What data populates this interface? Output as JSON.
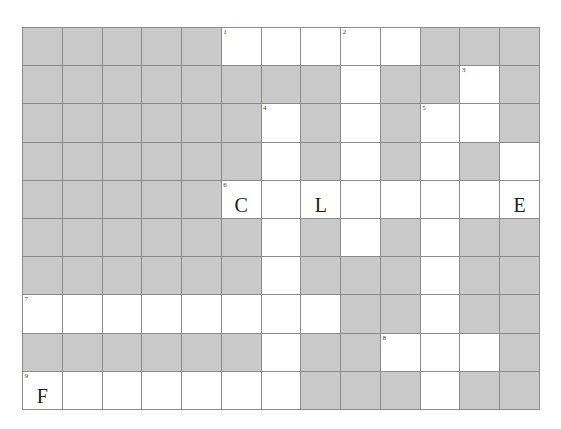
{
  "puzzle": {
    "title": "Crossword Grid",
    "columns": 13,
    "rows": 10,
    "colors": {
      "block_fill": "#c9c9c9",
      "open_fill": "#ffffff",
      "grid_line": "#8b8b8b",
      "text": "#1a1a1a",
      "number_text": "#3a3a3a"
    },
    "legend": {
      "block": "shaded/blocked square",
      "open": "fillable white square"
    },
    "clue_numbers": [
      1,
      2,
      3,
      4,
      5,
      6,
      7,
      8,
      9
    ],
    "filled_letters": [
      {
        "number": 6,
        "row": 5,
        "col": 6,
        "letter": "C"
      },
      {
        "row": 5,
        "col": 8,
        "letter": "L"
      },
      {
        "row": 5,
        "col": 13,
        "letter": "E"
      },
      {
        "number": 9,
        "row": 10,
        "col": 1,
        "letter": "F"
      }
    ],
    "cells": [
      [
        {
          "t": "block"
        },
        {
          "t": "block"
        },
        {
          "t": "block"
        },
        {
          "t": "block"
        },
        {
          "t": "block"
        },
        {
          "t": "open",
          "n": "1"
        },
        {
          "t": "open"
        },
        {
          "t": "open"
        },
        {
          "t": "open",
          "n": "2"
        },
        {
          "t": "open"
        },
        {
          "t": "block"
        },
        {
          "t": "block"
        },
        {
          "t": "block"
        }
      ],
      [
        {
          "t": "block"
        },
        {
          "t": "block"
        },
        {
          "t": "block"
        },
        {
          "t": "block"
        },
        {
          "t": "block"
        },
        {
          "t": "block"
        },
        {
          "t": "block"
        },
        {
          "t": "block"
        },
        {
          "t": "open"
        },
        {
          "t": "block"
        },
        {
          "t": "block"
        },
        {
          "t": "open",
          "n": "3"
        },
        {
          "t": "block"
        }
      ],
      [
        {
          "t": "block"
        },
        {
          "t": "block"
        },
        {
          "t": "block"
        },
        {
          "t": "block"
        },
        {
          "t": "block"
        },
        {
          "t": "block"
        },
        {
          "t": "open",
          "n": "4"
        },
        {
          "t": "block"
        },
        {
          "t": "open"
        },
        {
          "t": "block"
        },
        {
          "t": "open",
          "n": "5"
        },
        {
          "t": "open"
        },
        {
          "t": "block"
        }
      ],
      [
        {
          "t": "block"
        },
        {
          "t": "block"
        },
        {
          "t": "block"
        },
        {
          "t": "block"
        },
        {
          "t": "block"
        },
        {
          "t": "block"
        },
        {
          "t": "open"
        },
        {
          "t": "block"
        },
        {
          "t": "open"
        },
        {
          "t": "block"
        },
        {
          "t": "open"
        },
        {
          "t": "block"
        },
        {
          "t": "open"
        }
      ],
      [
        {
          "t": "block"
        },
        {
          "t": "block"
        },
        {
          "t": "block"
        },
        {
          "t": "block"
        },
        {
          "t": "block"
        },
        {
          "t": "open",
          "n": "6",
          "l": "C"
        },
        {
          "t": "open"
        },
        {
          "t": "open",
          "l": "L"
        },
        {
          "t": "open"
        },
        {
          "t": "open"
        },
        {
          "t": "open"
        },
        {
          "t": "open"
        },
        {
          "t": "open",
          "l": "E"
        }
      ],
      [
        {
          "t": "block"
        },
        {
          "t": "block"
        },
        {
          "t": "block"
        },
        {
          "t": "block"
        },
        {
          "t": "block"
        },
        {
          "t": "block"
        },
        {
          "t": "open"
        },
        {
          "t": "block"
        },
        {
          "t": "open"
        },
        {
          "t": "block"
        },
        {
          "t": "open"
        },
        {
          "t": "block"
        },
        {
          "t": "block"
        }
      ],
      [
        {
          "t": "block"
        },
        {
          "t": "block"
        },
        {
          "t": "block"
        },
        {
          "t": "block"
        },
        {
          "t": "block"
        },
        {
          "t": "block"
        },
        {
          "t": "open"
        },
        {
          "t": "block"
        },
        {
          "t": "block"
        },
        {
          "t": "block"
        },
        {
          "t": "open"
        },
        {
          "t": "block"
        },
        {
          "t": "block"
        }
      ],
      [
        {
          "t": "open",
          "n": "7"
        },
        {
          "t": "open"
        },
        {
          "t": "open"
        },
        {
          "t": "open"
        },
        {
          "t": "open"
        },
        {
          "t": "open"
        },
        {
          "t": "open"
        },
        {
          "t": "open"
        },
        {
          "t": "block"
        },
        {
          "t": "block"
        },
        {
          "t": "open"
        },
        {
          "t": "block"
        },
        {
          "t": "block"
        }
      ],
      [
        {
          "t": "block"
        },
        {
          "t": "block"
        },
        {
          "t": "block"
        },
        {
          "t": "block"
        },
        {
          "t": "block"
        },
        {
          "t": "block"
        },
        {
          "t": "open"
        },
        {
          "t": "block"
        },
        {
          "t": "block"
        },
        {
          "t": "open",
          "n": "8"
        },
        {
          "t": "open"
        },
        {
          "t": "open"
        },
        {
          "t": "block"
        }
      ],
      [
        {
          "t": "open",
          "n": "9",
          "l": "F"
        },
        {
          "t": "open"
        },
        {
          "t": "open"
        },
        {
          "t": "open"
        },
        {
          "t": "open"
        },
        {
          "t": "open"
        },
        {
          "t": "open"
        },
        {
          "t": "block"
        },
        {
          "t": "block"
        },
        {
          "t": "block"
        },
        {
          "t": "open"
        },
        {
          "t": "block"
        },
        {
          "t": "block"
        }
      ]
    ]
  }
}
